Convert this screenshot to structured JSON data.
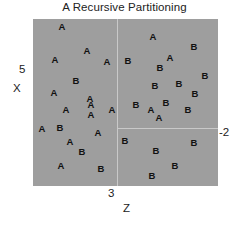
{
  "chart_data": {
    "type": "scatter",
    "title": "A Recursive Partitioning",
    "xlabel": "Z",
    "ylabel": "X",
    "grid": false,
    "legend": null,
    "axis_ticks": {
      "y_top": "5",
      "x_mid": "3",
      "right": "-2"
    },
    "plot_background": "#9e9e9e",
    "split_color": "#c9c9c9",
    "partitions": [
      {
        "name": "left",
        "split_variable": "Z",
        "split_value": 3,
        "orientation": "vertical",
        "x_px": 84
      },
      {
        "name": "right-lower",
        "split_variable": "X",
        "split_value": -2,
        "orientation": "horizontal",
        "y_px": 109
      }
    ],
    "classes": [
      "A",
      "B"
    ],
    "points": [
      {
        "label": "A",
        "x": 29,
        "y": 8
      },
      {
        "label": "A",
        "x": 54,
        "y": 32
      },
      {
        "label": "A",
        "x": 22,
        "y": 41
      },
      {
        "label": "A",
        "x": 74,
        "y": 43
      },
      {
        "label": "B",
        "x": 43,
        "y": 62
      },
      {
        "label": "A",
        "x": 21,
        "y": 74
      },
      {
        "label": "A",
        "x": 57,
        "y": 80
      },
      {
        "label": "A",
        "x": 33,
        "y": 91
      },
      {
        "label": "A",
        "x": 58,
        "y": 86
      },
      {
        "label": "A",
        "x": 58,
        "y": 96
      },
      {
        "label": "A",
        "x": 79,
        "y": 91
      },
      {
        "label": "A",
        "x": 9,
        "y": 110
      },
      {
        "label": "B",
        "x": 27,
        "y": 109
      },
      {
        "label": "A",
        "x": 65,
        "y": 114
      },
      {
        "label": "A",
        "x": 37,
        "y": 123
      },
      {
        "label": "B",
        "x": 49,
        "y": 133
      },
      {
        "label": "A",
        "x": 28,
        "y": 147
      },
      {
        "label": "B",
        "x": 68,
        "y": 150
      },
      {
        "label": "A",
        "x": 120,
        "y": 18
      },
      {
        "label": "B",
        "x": 161,
        "y": 28
      },
      {
        "label": "B",
        "x": 95,
        "y": 42
      },
      {
        "label": "A",
        "x": 137,
        "y": 39
      },
      {
        "label": "B",
        "x": 127,
        "y": 49
      },
      {
        "label": "B",
        "x": 172,
        "y": 57
      },
      {
        "label": "B",
        "x": 122,
        "y": 67
      },
      {
        "label": "B",
        "x": 146,
        "y": 65
      },
      {
        "label": "B",
        "x": 162,
        "y": 75
      },
      {
        "label": "B",
        "x": 103,
        "y": 86
      },
      {
        "label": "B",
        "x": 133,
        "y": 84
      },
      {
        "label": "A",
        "x": 118,
        "y": 91
      },
      {
        "label": "B",
        "x": 155,
        "y": 91
      },
      {
        "label": "A",
        "x": 126,
        "y": 99
      },
      {
        "label": "B",
        "x": 92,
        "y": 122
      },
      {
        "label": "B",
        "x": 161,
        "y": 124
      },
      {
        "label": "B",
        "x": 123,
        "y": 132
      },
      {
        "label": "B",
        "x": 142,
        "y": 147
      },
      {
        "label": "B",
        "x": 119,
        "y": 157
      }
    ]
  }
}
